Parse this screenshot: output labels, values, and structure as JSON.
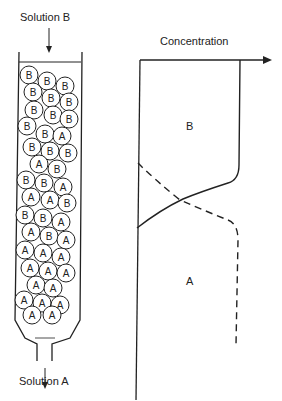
{
  "column": {
    "inlet_label": "Solution B",
    "outlet_label": "Solution A",
    "beads": [
      {
        "x": 29,
        "y": 75,
        "l": "B"
      },
      {
        "x": 47,
        "y": 81,
        "l": "B"
      },
      {
        "x": 65,
        "y": 86,
        "l": "B"
      },
      {
        "x": 33,
        "y": 92,
        "l": "B"
      },
      {
        "x": 51,
        "y": 98,
        "l": "B"
      },
      {
        "x": 69,
        "y": 102,
        "l": "B"
      },
      {
        "x": 34,
        "y": 110,
        "l": "B"
      },
      {
        "x": 53,
        "y": 115,
        "l": "B"
      },
      {
        "x": 69,
        "y": 119,
        "l": "B"
      },
      {
        "x": 27,
        "y": 126,
        "l": "B"
      },
      {
        "x": 45,
        "y": 134,
        "l": "B"
      },
      {
        "x": 62,
        "y": 136,
        "l": "A"
      },
      {
        "x": 32,
        "y": 147,
        "l": "B"
      },
      {
        "x": 50,
        "y": 151,
        "l": "B"
      },
      {
        "x": 68,
        "y": 153,
        "l": "B"
      },
      {
        "x": 39,
        "y": 164,
        "l": "A"
      },
      {
        "x": 57,
        "y": 169,
        "l": "B"
      },
      {
        "x": 26,
        "y": 180,
        "l": "B"
      },
      {
        "x": 44,
        "y": 183,
        "l": "B"
      },
      {
        "x": 63,
        "y": 187,
        "l": "A"
      },
      {
        "x": 31,
        "y": 197,
        "l": "A"
      },
      {
        "x": 50,
        "y": 200,
        "l": "A"
      },
      {
        "x": 67,
        "y": 203,
        "l": "B"
      },
      {
        "x": 25,
        "y": 215,
        "l": "B"
      },
      {
        "x": 43,
        "y": 218,
        "l": "B"
      },
      {
        "x": 61,
        "y": 222,
        "l": "A"
      },
      {
        "x": 31,
        "y": 232,
        "l": "A"
      },
      {
        "x": 49,
        "y": 236,
        "l": "B"
      },
      {
        "x": 66,
        "y": 240,
        "l": "A"
      },
      {
        "x": 25,
        "y": 250,
        "l": "A"
      },
      {
        "x": 43,
        "y": 253,
        "l": "A"
      },
      {
        "x": 61,
        "y": 257,
        "l": "A"
      },
      {
        "x": 30,
        "y": 268,
        "l": "A"
      },
      {
        "x": 48,
        "y": 271,
        "l": "A"
      },
      {
        "x": 66,
        "y": 273,
        "l": "A"
      },
      {
        "x": 36,
        "y": 285,
        "l": "A"
      },
      {
        "x": 53,
        "y": 288,
        "l": "A"
      },
      {
        "x": 24,
        "y": 300,
        "l": "A"
      },
      {
        "x": 42,
        "y": 303,
        "l": "A"
      },
      {
        "x": 60,
        "y": 305,
        "l": "A"
      },
      {
        "x": 32,
        "y": 315,
        "l": "A"
      },
      {
        "x": 52,
        "y": 315,
        "l": "A"
      }
    ]
  },
  "chart_data": {
    "type": "line",
    "title": "",
    "xlabel": "Concentration",
    "ylabel": "",
    "region_labels": [
      "B",
      "A"
    ],
    "series": [
      {
        "name": "B",
        "style": "solid",
        "description": "High concentration in upper column, drops sigmoidally to zero in the exchange zone"
      },
      {
        "name": "A",
        "style": "dashed",
        "description": "Zero in upper column, rises sigmoidally to high concentration in lower column"
      }
    ],
    "grid": false,
    "legend": "none"
  }
}
